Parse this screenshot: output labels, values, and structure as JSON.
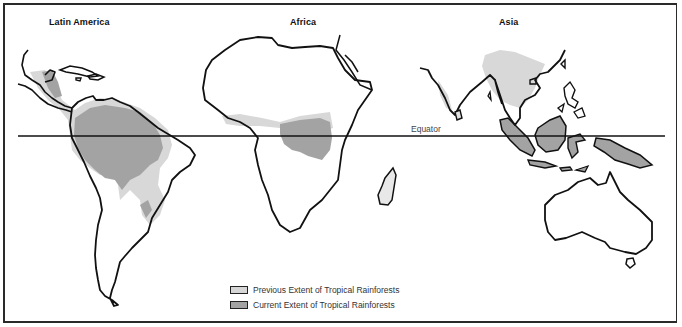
{
  "map": {
    "title": "Tropical Rainforest Extent",
    "regions": [
      {
        "label": "Latin America"
      },
      {
        "label": "Africa"
      },
      {
        "label": "Asia"
      }
    ],
    "equator_label": "Equator",
    "colors": {
      "outline": "#111111",
      "previous_extent": "#d6d6d6",
      "current_extent": "#9e9e9e",
      "background": "#ffffff"
    }
  },
  "legend": {
    "items": [
      {
        "label": "Previous Extent of Tropical Rainforests",
        "color": "#d6d6d6"
      },
      {
        "label": "Current Extent of Tropical Rainforests",
        "color": "#a3a3a3"
      }
    ]
  }
}
